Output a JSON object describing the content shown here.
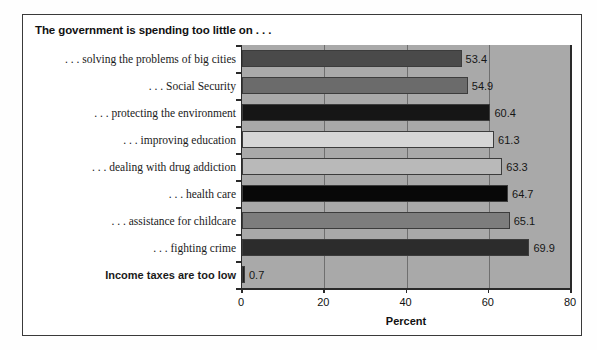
{
  "figure": {
    "title": "The government is spending too little on . . .",
    "background_color": "#ffffff",
    "frame_color": "#3a3a3a",
    "plot_background_color": "#a9a9a9"
  },
  "chart_data": {
    "type": "bar",
    "orientation": "horizontal",
    "title": "The government is spending too little on . . .",
    "xlabel": "Percent",
    "ylabel": "",
    "xlim": [
      0,
      80
    ],
    "ylim": null,
    "grid": true,
    "legend": null,
    "xticks": [
      "0",
      "20",
      "40",
      "60",
      "80"
    ],
    "xtick_values": [
      0,
      20,
      40,
      60,
      80
    ],
    "categories": [
      ". . . solving the problems of big cities",
      ". . . Social Security",
      ". . . protecting the environment",
      ". . . improving education",
      ". . . dealing with drug addiction",
      ". . . health care",
      ". . . assistance for childcare",
      ". . . fighting crime",
      "Income taxes are too low"
    ],
    "values": [
      53.4,
      54.9,
      60.4,
      61.3,
      63.3,
      64.7,
      65.1,
      69.9,
      0.7
    ],
    "value_labels": [
      "53.4",
      "54.9",
      "60.4",
      "61.3",
      "63.3",
      "64.7",
      "65.1",
      "69.9",
      "0.7"
    ],
    "bar_colors": [
      "#4a4a4a",
      "#6b6b6b",
      "#161616",
      "#d6d6d6",
      "#b9b9b9",
      "#080808",
      "#7d7d7d",
      "#2c2c2c",
      "#1d1d1d"
    ],
    "bold_categories": [
      "Income taxes are too low"
    ]
  }
}
